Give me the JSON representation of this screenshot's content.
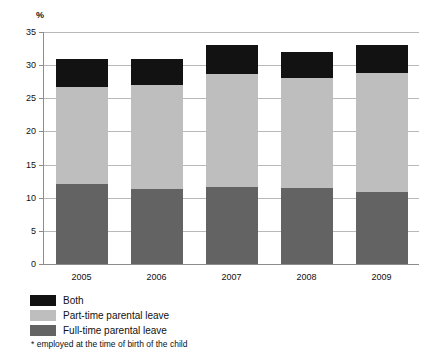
{
  "chart_data": {
    "type": "bar",
    "subtype": "stacked-column",
    "title": "",
    "xlabel": "",
    "ylabel": "%",
    "ylim": [
      0,
      35
    ],
    "yticks": [
      0,
      5,
      10,
      15,
      20,
      25,
      30,
      35
    ],
    "grid": true,
    "legend_position": "below-left",
    "categories": [
      "2005",
      "2006",
      "2007",
      "2008",
      "2009"
    ],
    "series": [
      {
        "name": "Full-time parental leave",
        "color": "#636363",
        "values": [
          12.0,
          11.3,
          11.6,
          11.5,
          10.8
        ]
      },
      {
        "name": "Part-time parental leave",
        "color": "#bebebe",
        "values": [
          14.7,
          15.7,
          17.1,
          16.5,
          18.0
        ]
      },
      {
        "name": "Both",
        "color": "#121212",
        "values": [
          4.3,
          4.0,
          4.3,
          4.0,
          4.2
        ]
      }
    ],
    "totals": [
      31.0,
      31.0,
      33.0,
      32.0,
      33.0
    ],
    "cumulative_tops": {
      "full_time": [
        12.0,
        11.3,
        11.6,
        11.5,
        10.8
      ],
      "part_time": [
        26.7,
        27.0,
        28.7,
        28.0,
        28.8
      ],
      "both": [
        31.0,
        31.0,
        33.0,
        32.0,
        33.0
      ]
    },
    "annotations": [
      "* employed at the time of birth of the child"
    ]
  },
  "axis": {
    "unit_label": "%",
    "y_tick_labels": [
      "0",
      "5",
      "10",
      "15",
      "20",
      "25",
      "30",
      "35"
    ],
    "x_tick_labels": [
      "2005",
      "2006",
      "2007",
      "2008",
      "2009"
    ]
  },
  "legend": {
    "items": [
      {
        "label": "Both",
        "color": "#121212"
      },
      {
        "label": "Part-time parental leave",
        "color": "#bebebe"
      },
      {
        "label": "Full-time parental leave",
        "color": "#636363"
      }
    ]
  },
  "footnote": {
    "text": "* employed at the time of birth of the child"
  }
}
